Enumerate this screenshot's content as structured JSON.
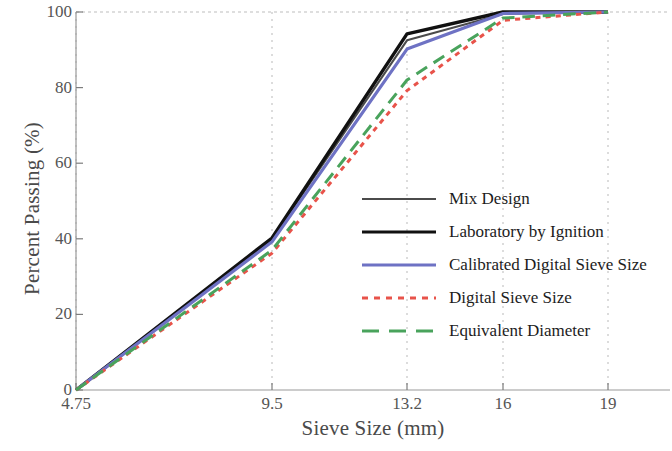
{
  "chart_data": {
    "type": "line",
    "title": "",
    "xlabel": "Sieve Size (mm)",
    "ylabel": "Percent Passing (%)",
    "x": [
      4.75,
      9.5,
      13.2,
      16,
      19
    ],
    "xtick_labels": [
      "4.75",
      "9.5",
      "13.2",
      "16",
      "19"
    ],
    "ytick_labels": [
      "0",
      "20",
      "40",
      "60",
      "80",
      "100"
    ],
    "ytick_values": [
      0,
      20,
      40,
      60,
      80,
      100
    ],
    "ylim": [
      0,
      100
    ],
    "grid": "vertical-dashed",
    "legend_position": "center-right",
    "series": [
      {
        "name": "Mix Design",
        "values": [
          0,
          40,
          92.5,
          99.5,
          100
        ],
        "color": "#4b4b4b",
        "style": "solid",
        "width": 2.1
      },
      {
        "name": "Laboratory by Ignition",
        "values": [
          0,
          40.2,
          94.2,
          100,
          100
        ],
        "color": "#111111",
        "style": "solid",
        "width": 3.4
      },
      {
        "name": "Calibrated Digital Sieve Size",
        "values": [
          0,
          39.2,
          90.2,
          99.6,
          100
        ],
        "color": "#6e72c4",
        "style": "solid",
        "width": 3.2
      },
      {
        "name": "Digital Sieve Size",
        "values": [
          0,
          36.2,
          79.2,
          97.8,
          100
        ],
        "color": "#e8534a",
        "style": "dotted",
        "width": 3.0
      },
      {
        "name": "Equivalent Diameter",
        "values": [
          0,
          37.0,
          82.0,
          98.4,
          100
        ],
        "color": "#49a35c",
        "style": "dashed",
        "width": 3.0
      }
    ]
  },
  "axes": {
    "frame_color": "#9a9a9a",
    "grid_color": "#b9b9b9"
  }
}
